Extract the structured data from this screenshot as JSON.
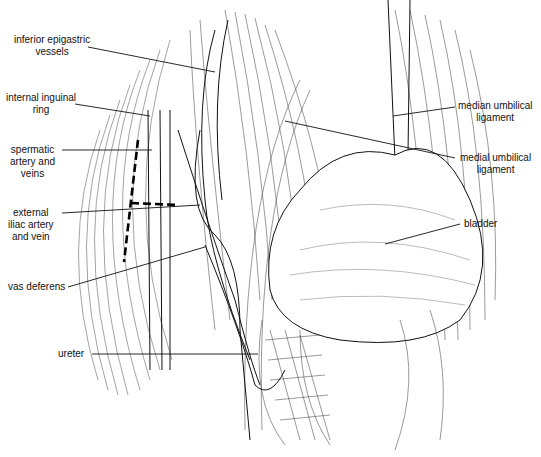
{
  "figure": {
    "type": "anatomical line illustration"
  },
  "labels": [
    {
      "id": "inferior-epigastric-vessels",
      "lines": [
        "inferior epigastric",
        "vessels"
      ],
      "side": "left"
    },
    {
      "id": "internal-inguinal-ring",
      "lines": [
        "internal inguinal",
        "ring"
      ],
      "side": "left"
    },
    {
      "id": "spermatic-artery-and-veins",
      "lines": [
        "spermatic",
        "artery and",
        "veins"
      ],
      "side": "left"
    },
    {
      "id": "external-iliac-artery-and-vein",
      "lines": [
        "external",
        "iliac artery",
        "and vein"
      ],
      "side": "left"
    },
    {
      "id": "vas-deferens",
      "lines": [
        "vas deferens"
      ],
      "side": "left"
    },
    {
      "id": "ureter",
      "lines": [
        "ureter"
      ],
      "side": "left"
    },
    {
      "id": "median-umbilical-ligament",
      "lines": [
        "median umbilical",
        "ligament"
      ],
      "side": "right"
    },
    {
      "id": "medial-umbilical-ligament",
      "lines": [
        "medial umbilical",
        "ligament"
      ],
      "side": "right"
    },
    {
      "id": "bladder",
      "lines": [
        "bladder"
      ],
      "side": "right"
    }
  ],
  "colors": {
    "ink": "#111111",
    "hatch": "#555555",
    "background": "#ffffff"
  }
}
